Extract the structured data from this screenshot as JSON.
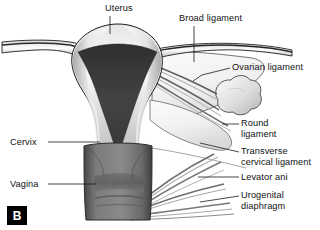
{
  "figure": {
    "type": "anatomical-illustration",
    "panel_tag": "B",
    "background_color": "#ffffff",
    "line_color": "#1a1a1a",
    "label_color": "#111111",
    "tissue_colors": {
      "uterine_wall_light": "#f2f2f2",
      "uterine_wall_mid": "#c9c9c9",
      "uterine_wall_shadow": "#9a9a9a",
      "endometrial_cavity": "#3c3c3c",
      "cervix": "#d8d8d8",
      "vagina": "#6e6e6e",
      "vagina_dark": "#4f4f4f",
      "ovary": "#dcdcdc",
      "broad_ligament": "#efefef"
    },
    "labels": [
      {
        "id": "uterus",
        "text": "Uterus",
        "lines": [
          "Uterus"
        ],
        "x": 105,
        "y": 4,
        "align": "left",
        "leader": "vertical"
      },
      {
        "id": "broad-ligament",
        "text": "Broad ligament",
        "lines": [
          "Broad ligament"
        ],
        "x": 179,
        "y": 14,
        "align": "left",
        "leader": "vertical"
      },
      {
        "id": "ovarian-ligament",
        "text": "Ovarian ligament",
        "lines": [
          "Ovarian ligament"
        ],
        "x": 232,
        "y": 63,
        "align": "left",
        "leader": "horizontal"
      },
      {
        "id": "round-ligament",
        "text": "Round ligament",
        "lines": [
          "Round",
          "ligament"
        ],
        "x": 241,
        "y": 119,
        "align": "left",
        "leader": "horizontal"
      },
      {
        "id": "transverse-cervical-ligament",
        "text": "Transverse cervical ligament",
        "lines": [
          "Transverse",
          "cervical ligament"
        ],
        "x": 241,
        "y": 146,
        "align": "left",
        "leader": "horizontal"
      },
      {
        "id": "levator-ani",
        "text": "Levator ani",
        "lines": [
          "Levator ani"
        ],
        "x": 241,
        "y": 173,
        "align": "left",
        "leader": "horizontal"
      },
      {
        "id": "urogenital-diaphragm",
        "text": "Urogenital diaphragm",
        "lines": [
          "Urogenital",
          "diaphragm"
        ],
        "x": 241,
        "y": 191,
        "align": "left",
        "leader": "horizontal"
      },
      {
        "id": "cervix",
        "text": "Cervix",
        "lines": [
          "Cervix"
        ],
        "x": 10,
        "y": 138,
        "align": "left",
        "leader": "horizontal"
      },
      {
        "id": "vagina",
        "text": "Vagina",
        "lines": [
          "Vagina"
        ],
        "x": 10,
        "y": 180,
        "align": "left",
        "leader": "horizontal"
      }
    ],
    "structures": [
      "fallopian-tube-left",
      "fallopian-tube-right",
      "uterine-fundus",
      "endometrial-cavity",
      "cervix-body",
      "vaginal-canal",
      "ovary",
      "broad-ligament-sheet",
      "ovarian-ligament-strands",
      "round-ligament-strands",
      "transverse-cervical-ligament-strands",
      "levator-ani-strands",
      "urogenital-diaphragm-strands"
    ]
  }
}
